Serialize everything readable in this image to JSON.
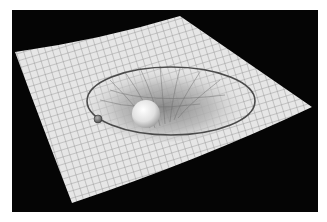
{
  "image": {
    "subject": "spacetime curvature illustration",
    "elements": [
      "grid-sheet",
      "gravity-well",
      "orbit-path",
      "massive-sphere",
      "orbiting-planet"
    ],
    "colors": {
      "background": "#050505",
      "sheet": "#e4e4e4",
      "grid": "#8a8a8a",
      "orbit": "#4a4a4a"
    }
  }
}
